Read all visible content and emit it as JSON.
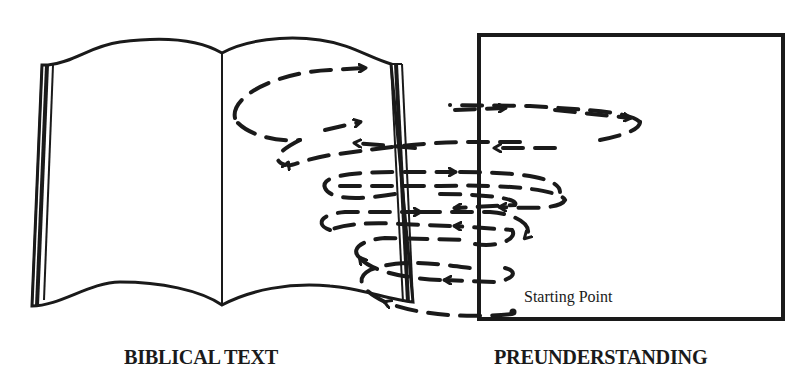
{
  "diagram": {
    "type": "hermeneutical-spiral",
    "left_object": {
      "icon": "open-book-icon",
      "label": "BIBLICAL TEXT"
    },
    "right_object": {
      "icon": "box-icon",
      "label": "PREUNDERSTANDING"
    },
    "annotation": {
      "label": "Starting Point"
    },
    "spiral": {
      "description": "Dashed arrowed spiral that starts at the bottom of the preunderstanding box and alternates between the biblical text and preunderstanding, widening as it rises",
      "loops": 6
    },
    "colors": {
      "ink": "#1a1a1a",
      "background": "#ffffff"
    }
  }
}
